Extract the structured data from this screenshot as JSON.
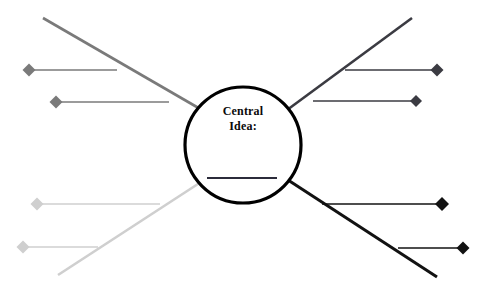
{
  "diagram": {
    "type": "concept-web-graphic-organizer",
    "title_text": {
      "line1": "Central",
      "line2": "Idea:"
    },
    "canvas": {
      "width": 482,
      "height": 290,
      "background": "#ffffff"
    },
    "center_node": {
      "shape": "circle",
      "cx": 243,
      "cy": 145,
      "r": 58,
      "stroke": "#000000",
      "stroke_width": 3.2,
      "fill": "#ffffff",
      "blank_line": {
        "x1": 207,
        "y1": 178,
        "x2": 277,
        "y2": 178,
        "stroke": "#2b2b3a",
        "stroke_width": 2
      }
    },
    "spokes": [
      {
        "name": "upper-left-spoke",
        "color": "#7a7a7a",
        "stroke_width": 2.6,
        "x1": 43,
        "y1": 18,
        "x2": 202,
        "y2": 110,
        "branches": [
          {
            "name": "upper-left-branch-1",
            "x1": 31,
            "y1": 70,
            "x2": 117,
            "y2": 70,
            "marker_x": 29,
            "marker_y": 70,
            "marker_size": 6.5,
            "color": "#7a7a7a",
            "stroke_width": 1.4
          },
          {
            "name": "upper-left-branch-2",
            "x1": 58,
            "y1": 102,
            "x2": 169,
            "y2": 102,
            "marker_x": 56,
            "marker_y": 102,
            "marker_size": 6.5,
            "color": "#7a7a7a",
            "stroke_width": 1.4
          }
        ]
      },
      {
        "name": "upper-right-spoke",
        "color": "#3b3b42",
        "stroke_width": 2.6,
        "x1": 412,
        "y1": 18,
        "x2": 287,
        "y2": 110,
        "branches": [
          {
            "name": "upper-right-branch-1",
            "x1": 345,
            "y1": 70,
            "x2": 436,
            "y2": 70,
            "marker_x": 437,
            "marker_y": 70,
            "marker_size": 6.5,
            "color": "#3b3b42",
            "stroke_width": 1.4
          },
          {
            "name": "upper-right-branch-2",
            "x1": 313,
            "y1": 101,
            "x2": 415,
            "y2": 101,
            "marker_x": 416,
            "marker_y": 101,
            "marker_size": 6,
            "color": "#3b3b42",
            "stroke_width": 1.4
          }
        ]
      },
      {
        "name": "lower-left-spoke",
        "color": "#cfcfcf",
        "stroke_width": 2.6,
        "x1": 58,
        "y1": 275,
        "x2": 201,
        "y2": 182,
        "branches": [
          {
            "name": "lower-left-branch-1",
            "x1": 38,
            "y1": 204,
            "x2": 160,
            "y2": 204,
            "marker_x": 37,
            "marker_y": 204,
            "marker_size": 6.5,
            "color": "#cfcfcf",
            "stroke_width": 1.4
          },
          {
            "name": "lower-left-branch-2",
            "x1": 25,
            "y1": 247,
            "x2": 98,
            "y2": 247,
            "marker_x": 23,
            "marker_y": 247,
            "marker_size": 6.5,
            "color": "#cfcfcf",
            "stroke_width": 1.4
          }
        ]
      },
      {
        "name": "lower-right-spoke",
        "color": "#121212",
        "stroke_width": 3,
        "x1": 437,
        "y1": 277,
        "x2": 288,
        "y2": 180,
        "branches": [
          {
            "name": "lower-right-branch-1",
            "x1": 322,
            "y1": 204,
            "x2": 440,
            "y2": 204,
            "marker_x": 442,
            "marker_y": 204,
            "marker_size": 7,
            "color": "#121212",
            "stroke_width": 1.6
          },
          {
            "name": "lower-right-branch-2",
            "x1": 398,
            "y1": 248,
            "x2": 461,
            "y2": 248,
            "marker_x": 463,
            "marker_y": 248,
            "marker_size": 6.5,
            "color": "#121212",
            "stroke_width": 1.6
          }
        ]
      }
    ]
  }
}
